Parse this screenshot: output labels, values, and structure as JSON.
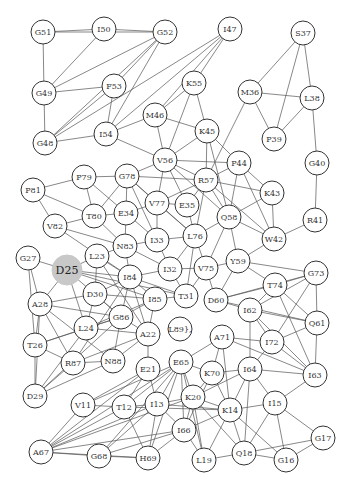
{
  "diagram": {
    "type": "network-graph",
    "highlighted_node": "D25",
    "colors": {
      "highlight_fill": "#c8c8c8",
      "node_stroke": "#333333",
      "edge": "#555555",
      "background": "#ffffff"
    },
    "nodes": [
      {
        "id": "G51",
        "x": 43,
        "y": 32
      },
      {
        "id": "I50",
        "x": 104,
        "y": 29
      },
      {
        "id": "G52",
        "x": 165,
        "y": 32
      },
      {
        "id": "I47",
        "x": 230,
        "y": 29
      },
      {
        "id": "S37",
        "x": 303,
        "y": 33
      },
      {
        "id": "G49",
        "x": 44,
        "y": 93
      },
      {
        "id": "F53",
        "x": 114,
        "y": 86
      },
      {
        "id": "K55",
        "x": 194,
        "y": 83
      },
      {
        "id": "M46",
        "x": 155,
        "y": 115
      },
      {
        "id": "M36",
        "x": 250,
        "y": 92
      },
      {
        "id": "L38",
        "x": 312,
        "y": 98
      },
      {
        "id": "G48",
        "x": 45,
        "y": 143
      },
      {
        "id": "I54",
        "x": 106,
        "y": 134
      },
      {
        "id": "P39",
        "x": 274,
        "y": 139
      },
      {
        "id": "K45",
        "x": 207,
        "y": 131
      },
      {
        "id": "G40",
        "x": 317,
        "y": 163
      },
      {
        "id": "V56",
        "x": 165,
        "y": 160
      },
      {
        "id": "P44",
        "x": 239,
        "y": 163
      },
      {
        "id": "P81",
        "x": 33,
        "y": 190
      },
      {
        "id": "P79",
        "x": 84,
        "y": 177
      },
      {
        "id": "G78",
        "x": 127,
        "y": 176
      },
      {
        "id": "R57",
        "x": 206,
        "y": 180
      },
      {
        "id": "K43",
        "x": 272,
        "y": 193
      },
      {
        "id": "E35",
        "x": 187,
        "y": 205
      },
      {
        "id": "V77",
        "x": 157,
        "y": 203
      },
      {
        "id": "T80",
        "x": 94,
        "y": 216
      },
      {
        "id": "E34",
        "x": 126,
        "y": 213
      },
      {
        "id": "Q58",
        "x": 229,
        "y": 217
      },
      {
        "id": "R41",
        "x": 315,
        "y": 220
      },
      {
        "id": "V82",
        "x": 55,
        "y": 226
      },
      {
        "id": "W42",
        "x": 274,
        "y": 239
      },
      {
        "id": "I33",
        "x": 157,
        "y": 240
      },
      {
        "id": "L76",
        "x": 195,
        "y": 236
      },
      {
        "id": "N83",
        "x": 125,
        "y": 246
      },
      {
        "id": "G27",
        "x": 28,
        "y": 258
      },
      {
        "id": "D25",
        "x": 67,
        "y": 270
      },
      {
        "id": "L23",
        "x": 97,
        "y": 256
      },
      {
        "id": "I32",
        "x": 170,
        "y": 269
      },
      {
        "id": "V75",
        "x": 206,
        "y": 268
      },
      {
        "id": "Y59",
        "x": 238,
        "y": 261
      },
      {
        "id": "G73",
        "x": 316,
        "y": 273
      },
      {
        "id": "I84",
        "x": 130,
        "y": 277
      },
      {
        "id": "D30",
        "x": 95,
        "y": 294
      },
      {
        "id": "T74",
        "x": 275,
        "y": 285
      },
      {
        "id": "A28",
        "x": 40,
        "y": 304
      },
      {
        "id": "I85",
        "x": 155,
        "y": 299
      },
      {
        "id": "T31",
        "x": 186,
        "y": 296
      },
      {
        "id": "D60",
        "x": 216,
        "y": 300
      },
      {
        "id": "I62",
        "x": 250,
        "y": 310
      },
      {
        "id": "Q61",
        "x": 317,
        "y": 323
      },
      {
        "id": "G86",
        "x": 121,
        "y": 317
      },
      {
        "id": "L24",
        "x": 86,
        "y": 328
      },
      {
        "id": "A22",
        "x": 148,
        "y": 334
      },
      {
        "id": "L89},",
        "x": 180,
        "y": 329
      },
      {
        "id": "I72",
        "x": 272,
        "y": 342
      },
      {
        "id": "A71",
        "x": 222,
        "y": 337
      },
      {
        "id": "T26",
        "x": 35,
        "y": 345
      },
      {
        "id": "R87",
        "x": 73,
        "y": 363
      },
      {
        "id": "N88",
        "x": 113,
        "y": 361
      },
      {
        "id": "D29",
        "x": 35,
        "y": 396
      },
      {
        "id": "E21",
        "x": 148,
        "y": 369
      },
      {
        "id": "E65",
        "x": 181,
        "y": 362
      },
      {
        "id": "K70",
        "x": 212,
        "y": 373
      },
      {
        "id": "I64",
        "x": 250,
        "y": 369
      },
      {
        "id": "I63",
        "x": 315,
        "y": 375
      },
      {
        "id": "K20",
        "x": 193,
        "y": 397
      },
      {
        "id": "V11",
        "x": 83,
        "y": 405
      },
      {
        "id": "T12",
        "x": 124,
        "y": 407
      },
      {
        "id": "I13",
        "x": 157,
        "y": 404
      },
      {
        "id": "K14",
        "x": 230,
        "y": 410
      },
      {
        "id": "I15",
        "x": 275,
        "y": 403
      },
      {
        "id": "I66",
        "x": 184,
        "y": 430
      },
      {
        "id": "G17",
        "x": 323,
        "y": 438
      },
      {
        "id": "A67",
        "x": 41,
        "y": 452
      },
      {
        "id": "G68",
        "x": 99,
        "y": 456
      },
      {
        "id": "H69",
        "x": 148,
        "y": 458
      },
      {
        "id": "L19",
        "x": 204,
        "y": 460
      },
      {
        "id": "Q18",
        "x": 244,
        "y": 453
      },
      {
        "id": "G16",
        "x": 286,
        "y": 460
      }
    ],
    "edges": [
      [
        "G51",
        "I50"
      ],
      [
        "I50",
        "G52"
      ],
      [
        "G51",
        "G52"
      ],
      [
        "G51",
        "G49"
      ],
      [
        "I50",
        "G49"
      ],
      [
        "G52",
        "G49"
      ],
      [
        "G52",
        "F53"
      ],
      [
        "G52",
        "G48"
      ],
      [
        "G52",
        "I54"
      ],
      [
        "G49",
        "F53"
      ],
      [
        "G49",
        "G48"
      ],
      [
        "F53",
        "I54"
      ],
      [
        "F53",
        "G48"
      ],
      [
        "I47",
        "G48"
      ],
      [
        "I47",
        "I54"
      ],
      [
        "I47",
        "K55"
      ],
      [
        "I47",
        "M46"
      ],
      [
        "G48",
        "I54"
      ],
      [
        "K55",
        "M46"
      ],
      [
        "K55",
        "K45"
      ],
      [
        "K55",
        "V56"
      ],
      [
        "M46",
        "I54"
      ],
      [
        "M46",
        "K45"
      ],
      [
        "M46",
        "V56"
      ],
      [
        "S37",
        "M36"
      ],
      [
        "S37",
        "L38"
      ],
      [
        "S37",
        "P39"
      ],
      [
        "M36",
        "L38"
      ],
      [
        "M36",
        "P39"
      ],
      [
        "M36",
        "R57"
      ],
      [
        "L38",
        "P39"
      ],
      [
        "L38",
        "G40"
      ],
      [
        "G40",
        "R41"
      ],
      [
        "R41",
        "W42"
      ],
      [
        "I54",
        "V56"
      ],
      [
        "K45",
        "V56"
      ],
      [
        "K45",
        "P44"
      ],
      [
        "K45",
        "R57"
      ],
      [
        "K45",
        "Q58"
      ],
      [
        "V56",
        "G78"
      ],
      [
        "V56",
        "R57"
      ],
      [
        "V56",
        "V77"
      ],
      [
        "V56",
        "E35"
      ],
      [
        "V56",
        "P44"
      ],
      [
        "V56",
        "Q58"
      ],
      [
        "P44",
        "R57"
      ],
      [
        "P44",
        "K43"
      ],
      [
        "P44",
        "Q58"
      ],
      [
        "P44",
        "W42"
      ],
      [
        "R57",
        "E35"
      ],
      [
        "R57",
        "K43"
      ],
      [
        "R57",
        "Q58"
      ],
      [
        "R57",
        "L76"
      ],
      [
        "R57",
        "W42"
      ],
      [
        "R57",
        "V77"
      ],
      [
        "K43",
        "Q58"
      ],
      [
        "K43",
        "W42"
      ],
      [
        "Q58",
        "W42"
      ],
      [
        "Q58",
        "L76"
      ],
      [
        "Q58",
        "Y59"
      ],
      [
        "Q58",
        "V75"
      ],
      [
        "W42",
        "Y59"
      ],
      [
        "P81",
        "P79"
      ],
      [
        "P81",
        "T80"
      ],
      [
        "P81",
        "V82"
      ],
      [
        "P79",
        "G78"
      ],
      [
        "P79",
        "T80"
      ],
      [
        "P79",
        "E34"
      ],
      [
        "G78",
        "T80"
      ],
      [
        "G78",
        "E34"
      ],
      [
        "G78",
        "V77"
      ],
      [
        "G78",
        "I33"
      ],
      [
        "G78",
        "R57"
      ],
      [
        "G78",
        "L76"
      ],
      [
        "T80",
        "E34"
      ],
      [
        "T80",
        "V82"
      ],
      [
        "T80",
        "N83"
      ],
      [
        "V82",
        "N83"
      ],
      [
        "V82",
        "I84"
      ],
      [
        "E34",
        "V77"
      ],
      [
        "E34",
        "N83"
      ],
      [
        "E34",
        "I33"
      ],
      [
        "V77",
        "I33"
      ],
      [
        "V77",
        "E35"
      ],
      [
        "V77",
        "L76"
      ],
      [
        "E35",
        "L76"
      ],
      [
        "I33",
        "N83"
      ],
      [
        "I33",
        "L76"
      ],
      [
        "I33",
        "I32"
      ],
      [
        "L76",
        "I32"
      ],
      [
        "L76",
        "V75"
      ],
      [
        "L76",
        "T31"
      ],
      [
        "N83",
        "L23"
      ],
      [
        "N83",
        "I84"
      ],
      [
        "N83",
        "I32"
      ],
      [
        "I32",
        "I84"
      ],
      [
        "I32",
        "T31"
      ],
      [
        "I32",
        "V75"
      ],
      [
        "V75",
        "Y59"
      ],
      [
        "V75",
        "T31"
      ],
      [
        "V75",
        "D60"
      ],
      [
        "Y59",
        "T74"
      ],
      [
        "Y59",
        "D60"
      ],
      [
        "G27",
        "D25"
      ],
      [
        "G27",
        "A28"
      ],
      [
        "G27",
        "T26"
      ],
      [
        "D25",
        "L23"
      ],
      [
        "D25",
        "A28"
      ],
      [
        "D25",
        "I85"
      ],
      [
        "D25",
        "G86"
      ],
      [
        "D25",
        "L24"
      ],
      [
        "D25",
        "T31"
      ],
      [
        "D25",
        "I84"
      ],
      [
        "L23",
        "I84"
      ],
      [
        "L23",
        "D30"
      ],
      [
        "L23",
        "A22"
      ],
      [
        "I84",
        "I85"
      ],
      [
        "I84",
        "T31"
      ],
      [
        "I84",
        "A22"
      ],
      [
        "I84",
        "G86"
      ],
      [
        "I84",
        "D30"
      ],
      [
        "I84",
        "R87"
      ],
      [
        "D30",
        "A28"
      ],
      [
        "D30",
        "G86"
      ],
      [
        "D30",
        "I85"
      ],
      [
        "D30",
        "L24"
      ],
      [
        "A28",
        "T26"
      ],
      [
        "A28",
        "G86"
      ],
      [
        "A28",
        "R87"
      ],
      [
        "A28",
        "N88"
      ],
      [
        "A28",
        "D29"
      ],
      [
        "I85",
        "T31"
      ],
      [
        "I85",
        "A22"
      ],
      [
        "I85",
        "G86"
      ],
      [
        "I85",
        "L24"
      ],
      [
        "G86",
        "L24"
      ],
      [
        "G86",
        "A22"
      ],
      [
        "G86",
        "T26"
      ],
      [
        "G86",
        "N88"
      ],
      [
        "G86",
        "D29"
      ],
      [
        "L24",
        "A22"
      ],
      [
        "L24",
        "T26"
      ],
      [
        "L24",
        "D29"
      ],
      [
        "A22",
        "N88"
      ],
      [
        "A22",
        "E21"
      ],
      [
        "A22",
        "L89"
      ],
      [
        "A22",
        "R87"
      ],
      [
        "T26",
        "R87"
      ],
      [
        "T26",
        "D29"
      ],
      [
        "R87",
        "N88"
      ],
      [
        "R87",
        "D29"
      ],
      [
        "N88",
        "D29"
      ],
      [
        "D60",
        "T74"
      ],
      [
        "D60",
        "I62"
      ],
      [
        "D60",
        "G73"
      ],
      [
        "D60",
        "Q61"
      ],
      [
        "T74",
        "G73"
      ],
      [
        "T74",
        "Q61"
      ],
      [
        "T74",
        "I62"
      ],
      [
        "T74",
        "I63"
      ],
      [
        "G73",
        "Q61"
      ],
      [
        "G73",
        "I62"
      ],
      [
        "G73",
        "I72"
      ],
      [
        "G73",
        "Y59"
      ],
      [
        "I62",
        "Q61"
      ],
      [
        "I62",
        "I72"
      ],
      [
        "I62",
        "I64"
      ],
      [
        "I62",
        "I63"
      ],
      [
        "Q61",
        "I72"
      ],
      [
        "Q61",
        "I63"
      ],
      [
        "I72",
        "A71"
      ],
      [
        "I72",
        "I64"
      ],
      [
        "I72",
        "I63"
      ],
      [
        "A71",
        "L89"
      ],
      [
        "A71",
        "E65"
      ],
      [
        "A71",
        "K70"
      ],
      [
        "A71",
        "I63"
      ],
      [
        "A71",
        "K14"
      ],
      [
        "L89",
        "E65"
      ],
      [
        "E65",
        "K70"
      ],
      [
        "E65",
        "K20"
      ],
      [
        "E65",
        "I13"
      ],
      [
        "E65",
        "T12"
      ],
      [
        "E65",
        "V11"
      ],
      [
        "E65",
        "I66"
      ],
      [
        "E65",
        "H69"
      ],
      [
        "E65",
        "G68"
      ],
      [
        "E65",
        "A67"
      ],
      [
        "E65",
        "L19"
      ],
      [
        "E21",
        "T12"
      ],
      [
        "E21",
        "V11"
      ],
      [
        "E21",
        "I13"
      ],
      [
        "E21",
        "A67"
      ],
      [
        "K70",
        "I64"
      ],
      [
        "K70",
        "K20"
      ],
      [
        "K70",
        "I66"
      ],
      [
        "K70",
        "K14"
      ],
      [
        "I64",
        "I63"
      ],
      [
        "I64",
        "K14"
      ],
      [
        "I64",
        "I15"
      ],
      [
        "I64",
        "Q18"
      ],
      [
        "I64",
        "K20"
      ],
      [
        "I63",
        "I15"
      ],
      [
        "K20",
        "I13"
      ],
      [
        "K20",
        "I66"
      ],
      [
        "K20",
        "K14"
      ],
      [
        "K20",
        "A67"
      ],
      [
        "K20",
        "L19"
      ],
      [
        "K20",
        "Q18"
      ],
      [
        "V11",
        "T12"
      ],
      [
        "V11",
        "A67"
      ],
      [
        "T12",
        "I13"
      ],
      [
        "T12",
        "A67"
      ],
      [
        "T12",
        "H69"
      ],
      [
        "T12",
        "K14"
      ],
      [
        "I13",
        "I66"
      ],
      [
        "I13",
        "A67"
      ],
      [
        "I13",
        "H69"
      ],
      [
        "I13",
        "G68"
      ],
      [
        "I13",
        "K14"
      ],
      [
        "K14",
        "I15"
      ],
      [
        "K14",
        "Q18"
      ],
      [
        "K14",
        "G16"
      ],
      [
        "K14",
        "L19"
      ],
      [
        "K14",
        "I66"
      ],
      [
        "I15",
        "Q18"
      ],
      [
        "I15",
        "G16"
      ],
      [
        "I15",
        "G17"
      ],
      [
        "I66",
        "A67"
      ],
      [
        "I66",
        "G68"
      ],
      [
        "I66",
        "H69"
      ],
      [
        "I66",
        "L19"
      ],
      [
        "A67",
        "G68"
      ],
      [
        "A67",
        "H69"
      ],
      [
        "G68",
        "H69"
      ],
      [
        "L19",
        "Q18"
      ],
      [
        "Q18",
        "G16"
      ],
      [
        "Q18",
        "G17"
      ],
      [
        "G16",
        "G17"
      ]
    ]
  }
}
